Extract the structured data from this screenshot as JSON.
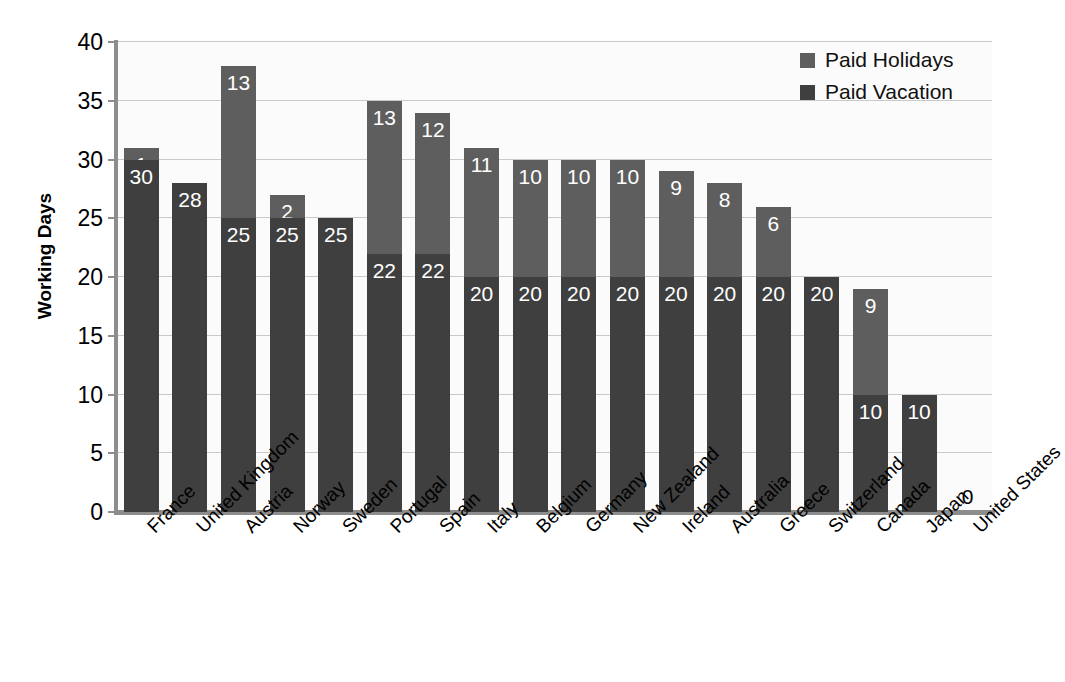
{
  "chart_data": {
    "type": "bar",
    "subtype": "stacked-vertical",
    "title": "",
    "xlabel": "",
    "ylabel": "Working Days",
    "ylim": [
      0,
      40
    ],
    "ytick_step": 5,
    "yticks": [
      "40",
      "35",
      "30",
      "25",
      "20",
      "15",
      "10",
      "5",
      "0"
    ],
    "grid": true,
    "grid_axis": "y",
    "legend_position": "top-right",
    "categories": [
      "France",
      "United Kingdom",
      "Austria",
      "Norway",
      "Sweden",
      "Portugal",
      "Spain",
      "Italy",
      "Belgium",
      "Germany",
      "New Zealand",
      "Ireland",
      "Australia",
      "Greece",
      "Switzerland",
      "Canada",
      "Japan",
      "United States"
    ],
    "series": [
      {
        "name": "Paid Vacation",
        "color": "#3f3f3f",
        "values": [
          30,
          28,
          25,
          25,
          25,
          22,
          22,
          20,
          20,
          20,
          20,
          20,
          20,
          20,
          20,
          10,
          10,
          0
        ]
      },
      {
        "name": "Paid Holidays",
        "color": "#5e5e5e",
        "values": [
          1,
          0,
          13,
          2,
          0,
          13,
          12,
          11,
          10,
          10,
          10,
          9,
          8,
          6,
          0,
          9,
          0,
          0
        ]
      }
    ],
    "totals": [
      31,
      28,
      38,
      27,
      25,
      35,
      34,
      31,
      30,
      30,
      30,
      29,
      28,
      26,
      20,
      19,
      10,
      0
    ],
    "data_labels": {
      "France": {
        "vacation": "30",
        "holiday": "1"
      },
      "United Kingdom": {
        "vacation": "28",
        "holiday": ""
      },
      "Austria": {
        "vacation": "25",
        "holiday": "13"
      },
      "Norway": {
        "vacation": "25",
        "holiday": "2"
      },
      "Sweden": {
        "vacation": "25",
        "holiday": ""
      },
      "Portugal": {
        "vacation": "22",
        "holiday": "13"
      },
      "Spain": {
        "vacation": "22",
        "holiday": "12"
      },
      "Italy": {
        "vacation": "20",
        "holiday": "11"
      },
      "Belgium": {
        "vacation": "20",
        "holiday": "10"
      },
      "Germany": {
        "vacation": "20",
        "holiday": "10"
      },
      "New Zealand": {
        "vacation": "20",
        "holiday": "10"
      },
      "Ireland": {
        "vacation": "20",
        "holiday": "9"
      },
      "Australia": {
        "vacation": "20",
        "holiday": "8"
      },
      "Greece": {
        "vacation": "20",
        "holiday": "6"
      },
      "Switzerland": {
        "vacation": "20",
        "holiday": ""
      },
      "Canada": {
        "vacation": "10",
        "holiday": "9"
      },
      "Japan": {
        "vacation": "10",
        "holiday": ""
      },
      "United States": {
        "vacation": "0",
        "holiday": ""
      }
    }
  },
  "legend": {
    "items": [
      {
        "label": "Paid Holidays",
        "color": "#5e5e5e",
        "swatch_name": "legend-swatch-paid-holidays"
      },
      {
        "label": "Paid Vacation",
        "color": "#3f3f3f",
        "swatch_name": "legend-swatch-paid-vacation"
      }
    ]
  },
  "axes": {
    "y_title": "Working Days"
  }
}
